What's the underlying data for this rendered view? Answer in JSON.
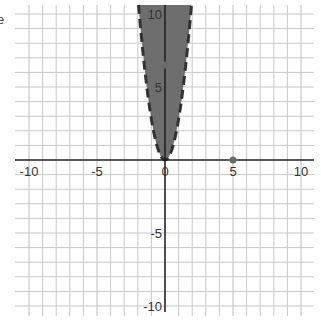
{
  "stray_text": "e",
  "chart_data": {
    "type": "area",
    "title": "",
    "xlabel": "",
    "ylabel": "",
    "xlim": [
      -10,
      10
    ],
    "ylim": [
      -10,
      10
    ],
    "grid": true,
    "grid_step": 1,
    "x_tick_labels": [
      "-10",
      "-5",
      "0",
      "5",
      "10"
    ],
    "y_tick_labels": [
      "10",
      "5",
      "-5",
      "-10"
    ],
    "x_ticks": [
      -10,
      -5,
      0,
      5,
      10
    ],
    "y_ticks": [
      10,
      5,
      -5,
      -10
    ],
    "series": [
      {
        "name": "inequality region",
        "kind": "shaded-parabola-interior",
        "boundary": "y = 2.8x^2",
        "coefficient": 2.8,
        "boundary_style": "dashed",
        "fill": "#6e6e6e",
        "stroke": "#333333"
      }
    ],
    "points": [
      {
        "x": 0,
        "y": 6.5,
        "color": "#6a6a6a"
      },
      {
        "x": 5,
        "y": 0,
        "color": "#6a6a6a"
      }
    ],
    "colors": {
      "grid": "#c8c8c8",
      "axis": "#222222",
      "fill": "#6e6e6e"
    }
  }
}
